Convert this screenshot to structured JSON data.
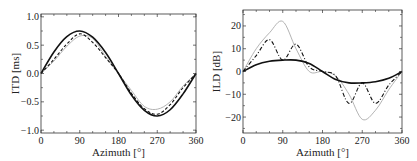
{
  "chart_data": [
    {
      "type": "line",
      "title": "",
      "xlabel": "Azimuth [°]",
      "ylabel": "ITD [ms]",
      "xlim": [
        0,
        360
      ],
      "ylim": [
        -1.05,
        1.05
      ],
      "xticks": [
        "0",
        "90",
        "180",
        "270",
        "360"
      ],
      "yticks": [
        "1.0",
        "0.5",
        "0.0",
        "-0.5",
        "-1.0"
      ],
      "grid": false,
      "x": [
        0,
        30,
        60,
        90,
        120,
        150,
        180,
        210,
        240,
        270,
        300,
        330,
        360
      ],
      "series": [
        {
          "name": "solid",
          "style": "solid-black",
          "values": [
            0,
            0.38,
            0.65,
            0.75,
            0.64,
            0.37,
            0,
            -0.38,
            -0.65,
            -0.75,
            -0.64,
            -0.36,
            0
          ]
        },
        {
          "name": "dashed",
          "style": "dashed-black",
          "values": [
            0,
            0.25,
            0.52,
            0.7,
            0.55,
            0.28,
            0,
            -0.35,
            -0.62,
            -0.72,
            -0.55,
            -0.25,
            0
          ]
        },
        {
          "name": "gray",
          "style": "solid-gray",
          "values": [
            0,
            0.22,
            0.48,
            0.66,
            0.62,
            0.3,
            0,
            -0.3,
            -0.58,
            -0.63,
            -0.5,
            -0.22,
            0
          ]
        }
      ]
    },
    {
      "type": "line",
      "title": "",
      "xlabel": "Azimuth [°]",
      "ylabel": "ILD [dB]",
      "xlim": [
        0,
        360
      ],
      "ylim": [
        -27,
        27
      ],
      "xticks": [
        "0",
        "90",
        "180",
        "270",
        "360"
      ],
      "yticks": [
        "20",
        "10",
        "0",
        "-10",
        "-20"
      ],
      "grid": false,
      "x": [
        0,
        30,
        60,
        90,
        120,
        150,
        180,
        210,
        240,
        270,
        300,
        330,
        360
      ],
      "series": [
        {
          "name": "solid",
          "style": "solid-black",
          "values": [
            0,
            3,
            4.5,
            5,
            5,
            3.5,
            0,
            -3.5,
            -5,
            -5,
            -4.5,
            -3,
            0
          ]
        },
        {
          "name": "dashed",
          "style": "dashdot-black",
          "values": [
            0,
            7,
            14,
            5,
            12,
            2,
            0,
            -2,
            -14,
            -5,
            -14,
            -6,
            0
          ]
        },
        {
          "name": "gray",
          "style": "solid-gray",
          "values": [
            0,
            10,
            17,
            22,
            10,
            0,
            0,
            -2,
            -10,
            -21,
            -17,
            -8,
            0
          ]
        }
      ]
    }
  ]
}
